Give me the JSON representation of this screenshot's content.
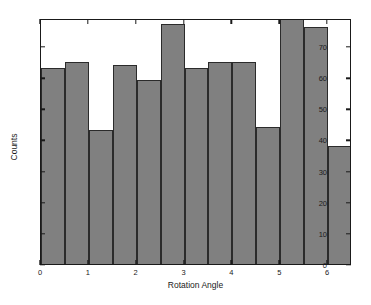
{
  "chart_data": {
    "type": "bar",
    "title": "",
    "subtitle": "",
    "xlabel": "Rotation Angle",
    "ylabel": "Counts",
    "xlim": [
      0,
      6.5
    ],
    "ylim": [
      0,
      79
    ],
    "bin_width": 0.5,
    "grid": false,
    "legend": null,
    "bar_color": "#808080",
    "edge_color": "#2b2b2b",
    "x_tick_labels": [
      "0",
      "1",
      "2",
      "3",
      "4",
      "5",
      "6"
    ],
    "x_tick_values": [
      0,
      1,
      2,
      3,
      4,
      5,
      6
    ],
    "y_tick_labels": [
      "0",
      "10",
      "20",
      "30",
      "40",
      "50",
      "60",
      "70"
    ],
    "y_tick_values": [
      0,
      10,
      20,
      30,
      40,
      50,
      60,
      70
    ],
    "bin_edges": [
      0,
      0.5,
      1.0,
      1.5,
      2.0,
      2.5,
      3.0,
      3.5,
      4.0,
      4.5,
      5.0,
      5.5,
      6.0,
      6.5
    ],
    "bin_centers": [
      0.25,
      0.75,
      1.25,
      1.75,
      2.25,
      2.75,
      3.25,
      3.75,
      4.25,
      4.75,
      5.25,
      5.75,
      6.25
    ],
    "categories": [
      "0-0.5",
      "0.5-1",
      "1-1.5",
      "1.5-2",
      "2-2.5",
      "2.5-3",
      "3-3.5",
      "3.5-4",
      "4-4.5",
      "4.5-5",
      "5-5.5",
      "5.5-6",
      "6-6.5"
    ],
    "values": [
      63,
      65,
      43,
      64,
      59,
      77,
      63,
      65,
      65,
      44,
      79,
      76,
      38
    ]
  }
}
